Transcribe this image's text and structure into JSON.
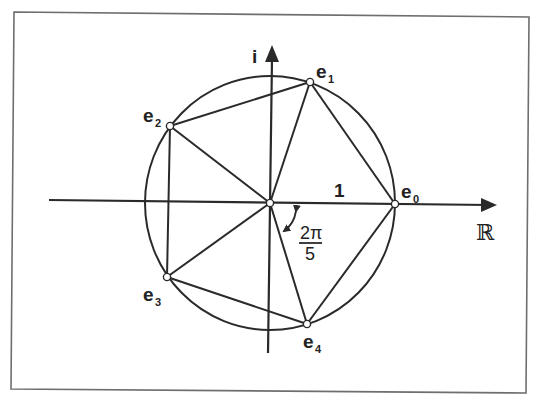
{
  "figure": {
    "colors": {
      "background": "#ffffff",
      "stroke": "#2a2a2a",
      "frame": "#6e6e6e",
      "vertex_fill": "#ffffff"
    },
    "axes": {
      "real_label": "ℝ",
      "imag_label": "i",
      "unit_label": "1"
    },
    "angle": {
      "numerator": "2π",
      "denominator": "5"
    },
    "vertices": [
      {
        "id": "e0",
        "base": "e",
        "sub": "0"
      },
      {
        "id": "e1",
        "base": "e",
        "sub": "1"
      },
      {
        "id": "e2",
        "base": "e",
        "sub": "2"
      },
      {
        "id": "e3",
        "base": "e",
        "sub": "3"
      },
      {
        "id": "e4",
        "base": "e",
        "sub": "4"
      }
    ]
  }
}
